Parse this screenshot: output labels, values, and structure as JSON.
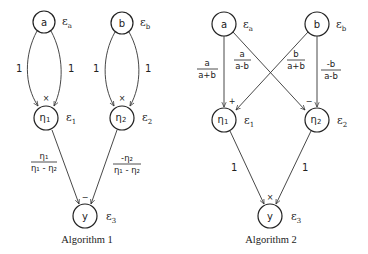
{
  "algorithm1": {
    "caption": "Algorithm 1",
    "nodes": {
      "a": {
        "label": "a",
        "error": "ε",
        "error_sub": "a"
      },
      "b": {
        "label": "b",
        "error": "ε",
        "error_sub": "b"
      },
      "eta1": {
        "label": "η",
        "label_sub": "1",
        "error": "ε",
        "error_sub": "1",
        "op": "×"
      },
      "eta2": {
        "label": "η",
        "label_sub": "2",
        "error": "ε",
        "error_sub": "2",
        "op": "×"
      },
      "y": {
        "label": "y",
        "error": "ε",
        "error_sub": "3",
        "op": "−"
      }
    },
    "edges": {
      "a_eta1_left": "1",
      "a_eta1_right": "1",
      "b_eta2_left": "1",
      "b_eta2_right": "1",
      "eta1_y": {
        "num": "η₁",
        "den": "η₁ - η₂"
      },
      "eta2_y": {
        "num": "-η₂",
        "den": "η₁ - η₂"
      }
    }
  },
  "algorithm2": {
    "caption": "Algorithm 2",
    "nodes": {
      "a": {
        "label": "a",
        "error": "ε",
        "error_sub": "a"
      },
      "b": {
        "label": "b",
        "error": "ε",
        "error_sub": "b"
      },
      "eta1": {
        "label": "η",
        "label_sub": "1",
        "error": "ε",
        "error_sub": "1",
        "op": "+"
      },
      "eta2": {
        "label": "η",
        "label_sub": "2",
        "error": "ε",
        "error_sub": "2",
        "op": "−"
      },
      "y": {
        "label": "y",
        "error": "ε",
        "error_sub": "3",
        "op": "×"
      }
    },
    "edges": {
      "a_eta1": {
        "num": "a",
        "den": "a+b"
      },
      "a_eta2": {
        "num": "a",
        "den": "a-b"
      },
      "b_eta1": {
        "num": "b",
        "den": "a+b"
      },
      "b_eta2": {
        "num": "-b",
        "den": "a-b"
      },
      "eta1_y": "1",
      "eta2_y": "1"
    }
  }
}
